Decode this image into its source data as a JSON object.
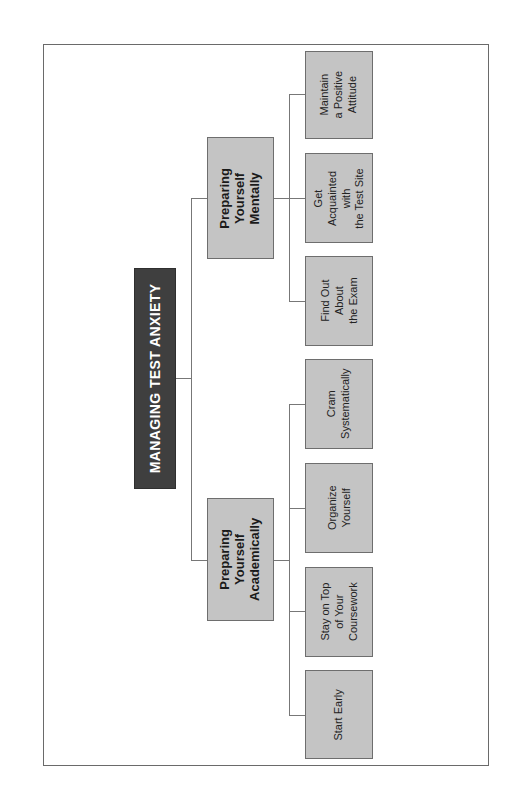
{
  "diagram": {
    "type": "hierarchy-tree",
    "orientation": "rotated-90-ccw",
    "colors": {
      "title_fill": "#3f3f3f",
      "title_text": "#ffffff",
      "node_fill": "#c4c4c4",
      "node_border": "#6e6e6e",
      "connector": "#777777",
      "frame": "#6a6a6a"
    },
    "root": {
      "label": "MANAGING TEST ANXIETY"
    },
    "branches": [
      {
        "label": "Preparing\nYourself\nMentally",
        "children": [
          {
            "label": "Maintain\na Positive\nAttitude"
          },
          {
            "label": "Get\nAcquainted with\nthe Test Site"
          },
          {
            "label": "Find Out\nAbout\nthe Exam"
          }
        ]
      },
      {
        "label": "Preparing\nYourself\nAcademically",
        "children": [
          {
            "label": "Cram\nSystematically"
          },
          {
            "label": "Organize\nYourself"
          },
          {
            "label": "Stay on Top\nof Your\nCoursework"
          },
          {
            "label": "Start Early"
          }
        ]
      }
    ]
  }
}
